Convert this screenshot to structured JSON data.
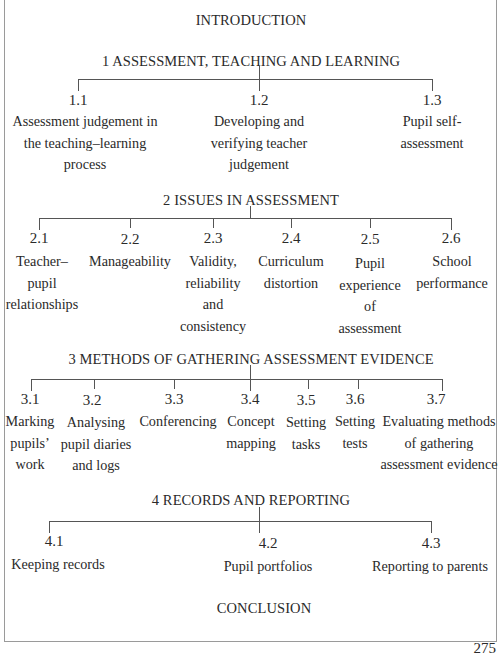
{
  "diagram": {
    "type": "hierarchy",
    "intro": "INTRODUCTION",
    "conclusion": "CONCLUSION",
    "page_number": "275",
    "sections": [
      {
        "heading": "1 ASSESSMENT, TEACHING AND LEARNING",
        "items": [
          {
            "num": "1.1",
            "lines": [
              "Assessment judgement in",
              "the teaching–learning",
              "process"
            ]
          },
          {
            "num": "1.2",
            "lines": [
              "Developing and",
              "verifying teacher",
              "judgement"
            ]
          },
          {
            "num": "1.3",
            "lines": [
              "Pupil self-",
              "assessment"
            ]
          }
        ]
      },
      {
        "heading": "2 ISSUES IN ASSESSMENT",
        "items": [
          {
            "num": "2.1",
            "lines": [
              "Teacher–",
              "pupil",
              "relationships"
            ]
          },
          {
            "num": "2.2",
            "lines": [
              "Manageability"
            ]
          },
          {
            "num": "2.3",
            "lines": [
              "Validity,",
              "reliability",
              "and",
              "consistency"
            ]
          },
          {
            "num": "2.4",
            "lines": [
              "Curriculum",
              "distortion"
            ]
          },
          {
            "num": "2.5",
            "lines": [
              "Pupil",
              "experience",
              "of",
              "assessment"
            ]
          },
          {
            "num": "2.6",
            "lines": [
              "School",
              "performance"
            ]
          }
        ]
      },
      {
        "heading": "3 METHODS OF GATHERING ASSESSMENT EVIDENCE",
        "items": [
          {
            "num": "3.1",
            "lines": [
              "Marking",
              "pupils’",
              "work"
            ]
          },
          {
            "num": "3.2",
            "lines": [
              "Analysing",
              "pupil diaries",
              "and logs"
            ]
          },
          {
            "num": "3.3",
            "lines": [
              "Conferencing"
            ]
          },
          {
            "num": "3.4",
            "lines": [
              "Concept",
              "mapping"
            ]
          },
          {
            "num": "3.5",
            "lines": [
              "Setting",
              "tasks"
            ]
          },
          {
            "num": "3.6",
            "lines": [
              "Setting",
              "tests"
            ]
          },
          {
            "num": "3.7",
            "lines": [
              "Evaluating methods",
              "of gathering",
              "assessment evidence"
            ]
          }
        ]
      },
      {
        "heading": "4 RECORDS AND REPORTING",
        "items": [
          {
            "num": "4.1",
            "lines": [
              "Keeping records"
            ]
          },
          {
            "num": "4.2",
            "lines": [
              "Pupil portfolios"
            ]
          },
          {
            "num": "4.3",
            "lines": [
              "Reporting to parents"
            ]
          }
        ]
      }
    ]
  }
}
